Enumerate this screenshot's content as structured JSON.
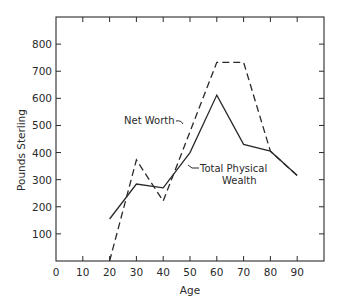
{
  "chart_data": {
    "type": "line",
    "title": "",
    "xlabel": "Age",
    "ylabel": "Pounds Sterling",
    "xlim": [
      0,
      100
    ],
    "ylim": [
      0,
      900
    ],
    "x_ticks": [
      0,
      10,
      20,
      30,
      40,
      50,
      60,
      70,
      80,
      90
    ],
    "y_ticks": [
      100,
      200,
      300,
      400,
      500,
      600,
      700,
      800
    ],
    "grid": false,
    "legend": "none (inline annotations)",
    "series": [
      {
        "name": "Net Worth",
        "style": "dashed",
        "x": [
          20,
          30,
          40,
          60,
          70,
          80,
          90
        ],
        "values": [
          0,
          373,
          221,
          733,
          733,
          405,
          315
        ]
      },
      {
        "name": "Total Physical Wealth",
        "style": "solid",
        "x": [
          20,
          30,
          40,
          50,
          60,
          70,
          80,
          90
        ],
        "values": [
          155,
          284,
          270,
          400,
          612,
          430,
          405,
          315
        ]
      }
    ],
    "annotations": [
      {
        "text": "Net Worth",
        "points_to": "Net Worth"
      },
      {
        "text": "Total Physical Wealth",
        "lines": [
          "Total Physical",
          "Wealth"
        ],
        "points_to": "Total Physical Wealth"
      }
    ]
  },
  "labels": {
    "xlabel": "Age",
    "ylabel": "Pounds Sterling",
    "net_worth": "Net Worth",
    "tpw_line1": "Total Physical",
    "tpw_line2": "Wealth"
  },
  "colors": {
    "ink": "#2a2a2a",
    "background": "#ffffff"
  }
}
